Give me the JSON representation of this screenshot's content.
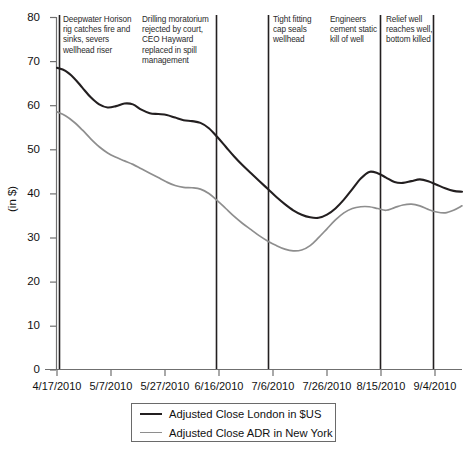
{
  "chart_data": {
    "type": "line",
    "title": "",
    "xlabel": "",
    "ylabel": "(in $)",
    "ylim": [
      0,
      80
    ],
    "ytick_labels": [
      "0",
      "10",
      "20",
      "30",
      "40",
      "50",
      "60",
      "70",
      "80"
    ],
    "ytick_values": [
      0,
      10,
      20,
      30,
      40,
      50,
      60,
      70,
      80
    ],
    "xtick_labels": [
      "4/17/2010",
      "5/7/2010",
      "5/27/2010",
      "6/16/2010",
      "7/6/2010",
      "7/26/2010",
      "8/15/2010",
      "9/4/2010"
    ],
    "grid": false,
    "legend_position": "bottom",
    "series": [
      {
        "name": "Adjusted Close London in $US",
        "color": "#231f20",
        "x": [
          0,
          3,
          6,
          9,
          12,
          15,
          18,
          21,
          24,
          27,
          30,
          33,
          36,
          39,
          42,
          45,
          48,
          51,
          54,
          57,
          60,
          63,
          66,
          69,
          72,
          75,
          78,
          81,
          84,
          87,
          90,
          93,
          96,
          99,
          102,
          105,
          108,
          111,
          114,
          117,
          120,
          123,
          126,
          129,
          132,
          135,
          138,
          141,
          144
        ],
        "values": [
          68.5,
          67.8,
          66.2,
          64.0,
          61.8,
          60.2,
          59.5,
          59.8,
          60.4,
          60.2,
          59.0,
          58.2,
          58.0,
          57.8,
          57.2,
          56.6,
          56.4,
          56.0,
          54.8,
          52.8,
          50.6,
          48.4,
          46.4,
          44.6,
          42.8,
          41.0,
          39.2,
          37.6,
          36.2,
          35.2,
          34.6,
          34.5,
          35.2,
          36.6,
          38.6,
          41.0,
          43.4,
          44.9,
          44.6,
          43.6,
          42.6,
          42.4,
          42.8,
          43.2,
          42.8,
          42.0,
          41.2,
          40.6,
          40.4
        ]
      },
      {
        "name": "Adjusted Close ADR in New York",
        "color": "#8e8e8e",
        "x": [
          0,
          3,
          6,
          9,
          12,
          15,
          18,
          21,
          24,
          27,
          30,
          33,
          36,
          39,
          42,
          45,
          48,
          51,
          54,
          57,
          60,
          63,
          66,
          69,
          72,
          75,
          78,
          81,
          84,
          87,
          90,
          93,
          96,
          99,
          102,
          105,
          108,
          111,
          114,
          117,
          120,
          123,
          126,
          129,
          132,
          135,
          138,
          141,
          144
        ],
        "values": [
          58.5,
          57.6,
          56.2,
          54.4,
          52.4,
          50.6,
          49.2,
          48.2,
          47.4,
          46.6,
          45.6,
          44.6,
          43.6,
          42.6,
          41.8,
          41.4,
          41.3,
          41.0,
          40.0,
          38.4,
          36.6,
          34.8,
          33.2,
          31.8,
          30.4,
          29.2,
          28.2,
          27.4,
          27.0,
          27.2,
          28.2,
          30.0,
          32.0,
          34.0,
          35.6,
          36.6,
          37.0,
          37.0,
          36.6,
          36.2,
          36.8,
          37.4,
          37.6,
          37.2,
          36.4,
          35.8,
          35.6,
          36.2,
          37.2
        ]
      }
    ],
    "annotations": [
      {
        "id": "deepwater-horizon",
        "text": "Deepwater Horison\nrig catches fire and\nsinks, severs\nwellhead riser"
      },
      {
        "id": "drilling-moratorium",
        "text": "Drilling moratorium\nrejected by court,\nCEO Hayward\nreplaced in spill\nmanagement"
      },
      {
        "id": "tight-fitting-cap",
        "text": "Tight fitting\ncap seals\nwellhead"
      },
      {
        "id": "static-kill",
        "text": "Engineers\ncement static\nkill of well"
      },
      {
        "id": "relief-well",
        "text": "Relief well\nreaches well,\nbottom killed"
      }
    ],
    "event_lines": [
      {
        "id": "event-line-1"
      },
      {
        "id": "event-line-2"
      },
      {
        "id": "event-line-3"
      },
      {
        "id": "event-line-4"
      },
      {
        "id": "event-line-5"
      }
    ]
  },
  "legend": {
    "entries": [
      {
        "label": "Adjusted Close London in $US"
      },
      {
        "label": "Adjusted Close ADR in New York"
      }
    ]
  }
}
